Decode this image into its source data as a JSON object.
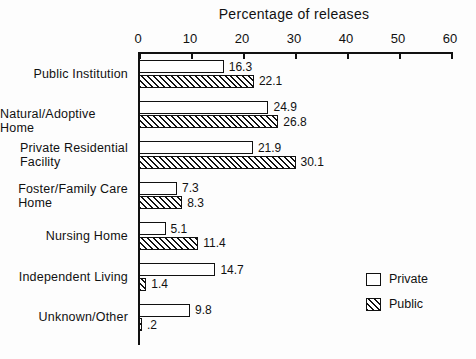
{
  "chart_data": {
    "type": "bar",
    "orientation": "horizontal",
    "title": "Percentage of releases",
    "xlabel": "",
    "ylabel": "",
    "xlim": [
      0,
      60
    ],
    "xticks": [
      0,
      10,
      20,
      30,
      40,
      50,
      60
    ],
    "xtick_labels": [
      "0",
      "10",
      "20",
      "30",
      "40",
      "50",
      "60"
    ],
    "grid": false,
    "legend_position": "bottom-right",
    "categories": [
      "Public Institution",
      "Natural/Adoptive Home",
      "Private Residential Facility",
      "Foster/Family Care Home",
      "Nursing Home",
      "Independent Living",
      "Unknown/Other"
    ],
    "category_lines": [
      [
        "Public Institution"
      ],
      [
        "Natural/Adoptive Home"
      ],
      [
        "Private Residential",
        "Facility"
      ],
      [
        "Foster/Family Care",
        "Home"
      ],
      [
        "Nursing Home"
      ],
      [
        "Independent Living"
      ],
      [
        "Unknown/Other"
      ]
    ],
    "series": [
      {
        "name": "Private",
        "fill": "hollow",
        "values": [
          16.3,
          24.9,
          21.9,
          7.3,
          5.1,
          14.7,
          9.8
        ],
        "value_labels": [
          "16.3",
          "24.9",
          "21.9",
          "7.3",
          "5.1",
          "14.7",
          "9.8"
        ]
      },
      {
        "name": "Public",
        "fill": "hatched",
        "values": [
          22.1,
          26.8,
          30.1,
          8.3,
          11.4,
          1.4,
          0.2
        ],
        "value_labels": [
          "22.1",
          "26.8",
          "30.1",
          "8.3",
          "11.4",
          "1.4",
          ".2"
        ]
      }
    ]
  },
  "legend": {
    "items": [
      {
        "label": "Private",
        "fill": "hollow"
      },
      {
        "label": "Public",
        "fill": "hatched"
      }
    ]
  },
  "colors": {
    "ink": "#111111",
    "paper": "#fdfdfd"
  }
}
